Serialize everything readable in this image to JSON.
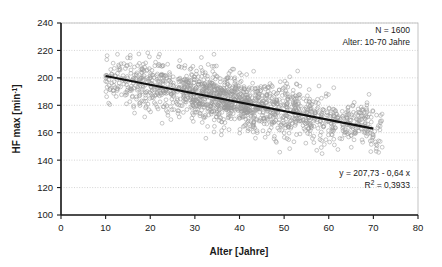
{
  "chart_data": {
    "type": "scatter",
    "title": "",
    "xlabel": "Alter [Jahre]",
    "ylabel": "HF max [min-1]",
    "ylabel_base": "HF max [min",
    "ylabel_sup": "-1",
    "ylabel_tail": "]",
    "xlim": [
      0,
      80
    ],
    "ylim": [
      100,
      240
    ],
    "xticks": [
      "0",
      "10",
      "20",
      "30",
      "40",
      "50",
      "60",
      "70",
      "80"
    ],
    "xtick_values": [
      0,
      10,
      20,
      30,
      40,
      50,
      60,
      70,
      80
    ],
    "yticks": [
      "100",
      "120",
      "140",
      "160",
      "180",
      "200",
      "220",
      "240"
    ],
    "ytick_values": [
      100,
      120,
      140,
      160,
      180,
      200,
      220,
      240
    ],
    "grid": "horizontal-dotted",
    "grid_color": "#c9c9c9",
    "legend": "none",
    "marker": {
      "shape": "open-circle",
      "stroke_color": "#9a9a9a",
      "fill": "none",
      "radius": 1.9
    },
    "series": [
      {
        "name": "HF max vs Alter",
        "n_points": 1600,
        "x_range": [
          10,
          72
        ],
        "y_range": [
          134,
          219
        ]
      }
    ],
    "trendline": {
      "type": "linear",
      "intercept": 207.73,
      "slope": -0.64,
      "x_start": 10,
      "x_end": 70,
      "y_start": 201.33,
      "y_end": 162.93,
      "color": "#111111",
      "width": 2.2
    },
    "annotations": [
      {
        "name": "sample-info",
        "lines": [
          "N = 1600",
          "Alter: 10-70 Jahre"
        ],
        "position": "top-right"
      },
      {
        "name": "regression-stats",
        "lines": [
          "y = 207,73  - 0,64 x",
          "R² = 0,3933"
        ],
        "position": "bottom-right"
      }
    ]
  },
  "annotations": {
    "sample": {
      "line1": "N = 1600",
      "line2": "Alter: 10-70 Jahre"
    },
    "regression": {
      "equation": "y = 207,73  - 0,64 x",
      "r_squared_label": "R",
      "r_squared_sup": "2",
      "r_squared_value": " = 0,3933"
    }
  },
  "axes": {
    "x_title": "Alter [Jahre]",
    "y_title_base": "HF max [min",
    "y_title_sup": "-1",
    "y_title_tail": "]"
  }
}
